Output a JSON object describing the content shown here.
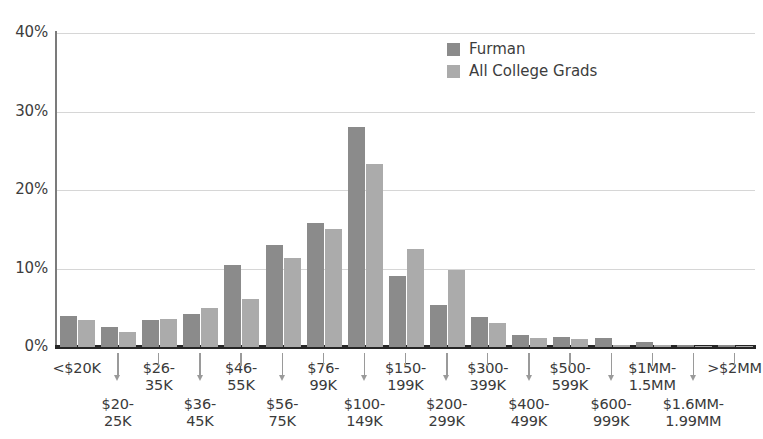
{
  "chart_data": {
    "type": "bar",
    "title": "",
    "subtitle": "",
    "xlabel": "",
    "ylabel": "",
    "ylim": [
      0,
      40
    ],
    "yticks": [
      "0%",
      "10%",
      "20%",
      "30%",
      "40%"
    ],
    "ytick_values": [
      0,
      10,
      20,
      30,
      40
    ],
    "grid": true,
    "legend_position": "top-center-right",
    "categories": [
      "<$20K",
      "$20-25K",
      "$26-35K",
      "$36-45K",
      "$46-55K",
      "$56-75K",
      "$76-99K",
      "$100-149K",
      "$150-199K",
      "$200-299K",
      "$300-399K",
      "$400-499K",
      "$500-599K",
      "$600-999K",
      "$1MM-1.5MM",
      "$1.6MM-1.99MM",
      ">$2MM"
    ],
    "category_labels": [
      {
        "line1": "<$20K",
        "line2": "",
        "row": "top"
      },
      {
        "line1": "$20-",
        "line2": "25K",
        "row": "bottom"
      },
      {
        "line1": "$26-",
        "line2": "35K",
        "row": "top"
      },
      {
        "line1": "$36-",
        "line2": "45K",
        "row": "bottom"
      },
      {
        "line1": "$46-",
        "line2": "55K",
        "row": "top"
      },
      {
        "line1": "$56-",
        "line2": "75K",
        "row": "bottom"
      },
      {
        "line1": "$76-",
        "line2": "99K",
        "row": "top"
      },
      {
        "line1": "$100-",
        "line2": "149K",
        "row": "bottom"
      },
      {
        "line1": "$150-",
        "line2": "199K",
        "row": "top"
      },
      {
        "line1": "$200-",
        "line2": "299K",
        "row": "bottom"
      },
      {
        "line1": "$300-",
        "line2": "399K",
        "row": "top"
      },
      {
        "line1": "$400-",
        "line2": "499K",
        "row": "bottom"
      },
      {
        "line1": "$500-",
        "line2": "599K",
        "row": "top"
      },
      {
        "line1": "$600-",
        "line2": "999K",
        "row": "bottom"
      },
      {
        "line1": "$1MM-",
        "line2": "1.5MM",
        "row": "top"
      },
      {
        "line1": "$1.6MM-",
        "line2": "1.99MM",
        "row": "bottom"
      },
      {
        "line1": ">$2MM",
        "line2": "",
        "row": "top"
      }
    ],
    "series": [
      {
        "name": "Furman",
        "color": "#8b8b8b",
        "values": [
          4.0,
          2.6,
          3.4,
          4.2,
          10.4,
          13.0,
          15.8,
          28.0,
          9.0,
          5.4,
          3.8,
          1.5,
          1.3,
          1.1,
          0.7,
          0.3,
          0.2
        ]
      },
      {
        "name": "All College Grads",
        "color": "#ababab",
        "values": [
          3.5,
          1.9,
          3.6,
          5.0,
          6.1,
          11.4,
          15.0,
          23.3,
          12.5,
          9.8,
          3.0,
          1.2,
          1.0,
          0.2,
          0.2,
          0.1,
          0.1
        ]
      }
    ]
  },
  "legend": {
    "items": [
      {
        "label": "Furman",
        "color": "#8b8b8b"
      },
      {
        "label": "All College Grads",
        "color": "#ababab"
      }
    ]
  },
  "axis": {
    "y_ticks": [
      "40%",
      "30%",
      "20%",
      "10%",
      "0%"
    ]
  }
}
